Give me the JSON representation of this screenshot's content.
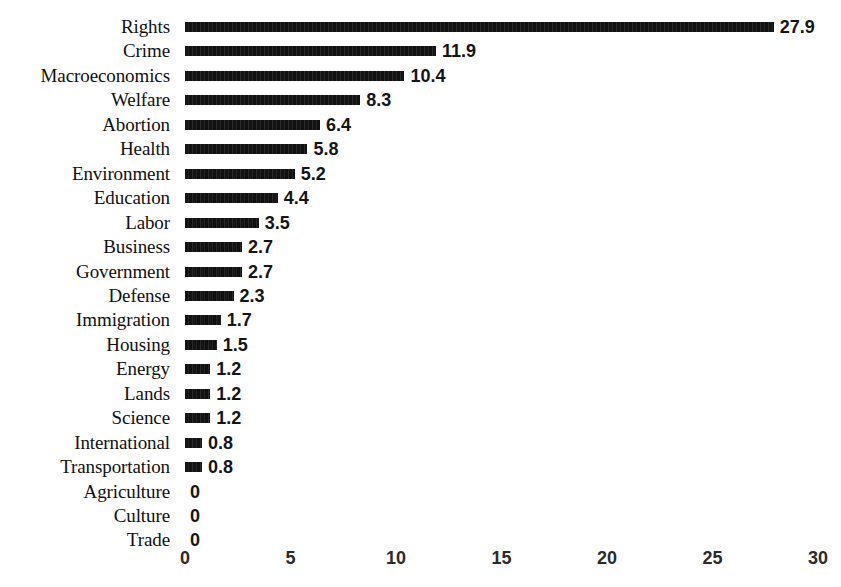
{
  "chart_data": {
    "type": "bar",
    "orientation": "horizontal",
    "title": "",
    "subtitle": "",
    "xlabel": "",
    "ylabel": "",
    "xlim": [
      0,
      30
    ],
    "xticks": [
      "0",
      "5",
      "10",
      "15",
      "20",
      "25",
      "30"
    ],
    "xtick_values": [
      0,
      5,
      10,
      15,
      20,
      25,
      30
    ],
    "grid": false,
    "legend": false,
    "legend_position": "none",
    "bar_color": "#161616",
    "background_color": "#ffffff",
    "text_color": "#111111",
    "categories": [
      "Rights",
      "Crime",
      "Macroeconomics",
      "Welfare",
      "Abortion",
      "Health",
      "Environment",
      "Education",
      "Labor",
      "Business",
      "Government",
      "Defense",
      "Immigration",
      "Housing",
      "Energy",
      "Lands",
      "Science",
      "International",
      "Transportation",
      "Agriculture",
      "Culture",
      "Trade"
    ],
    "values": [
      27.9,
      11.9,
      10.4,
      8.3,
      6.4,
      5.8,
      5.2,
      4.4,
      3.5,
      2.7,
      2.7,
      2.3,
      1.7,
      1.5,
      1.2,
      1.2,
      1.2,
      0.8,
      0.8,
      0,
      0,
      0
    ],
    "value_labels": [
      "27.9",
      "11.9",
      "10.4",
      "8.3",
      "6.4",
      "5.8",
      "5.2",
      "4.4",
      "3.5",
      "2.7",
      "2.7",
      "2.3",
      "1.7",
      "1.5",
      "1.2",
      "1.2",
      "1.2",
      "0.8",
      "0.8",
      "0",
      "0",
      "0"
    ]
  }
}
